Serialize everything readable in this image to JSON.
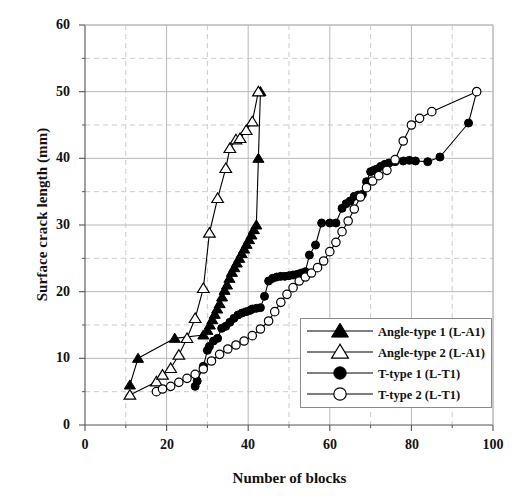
{
  "chart_data": {
    "type": "line",
    "title": "",
    "xlabel": "Number of blocks",
    "ylabel": "Surface crack length (mm)",
    "xlim": [
      0,
      100
    ],
    "ylim": [
      0,
      60
    ],
    "xticks": [
      0,
      20,
      40,
      60,
      80,
      100
    ],
    "yticks": [
      0,
      10,
      20,
      30,
      40,
      50,
      60
    ],
    "xminor_step": 10,
    "yminor_step": 5,
    "grid": true,
    "grid_major_style": "solid",
    "grid_minor_style": "dashed",
    "legend_position": "lower right",
    "series": [
      {
        "name": "Angle-type 1 (L-A1)",
        "marker": "filled-triangle",
        "color": "#000000",
        "points": [
          [
            11,
            6.0
          ],
          [
            13,
            10.0
          ],
          [
            22,
            13.0
          ],
          [
            29,
            13.5
          ],
          [
            30,
            14.2
          ],
          [
            30.6,
            15.0
          ],
          [
            31.2,
            15.8
          ],
          [
            31.8,
            16.6
          ],
          [
            32.4,
            17.4
          ],
          [
            33,
            18.2
          ],
          [
            33.6,
            19.2
          ],
          [
            34.2,
            20.2
          ],
          [
            34.8,
            21.0
          ],
          [
            35.4,
            22.0
          ],
          [
            36,
            22.9
          ],
          [
            36.6,
            23.6
          ],
          [
            37.2,
            24.3
          ],
          [
            37.8,
            25.0
          ],
          [
            38.4,
            25.7
          ],
          [
            39,
            26.4
          ],
          [
            39.6,
            27.1
          ],
          [
            40.2,
            27.8
          ],
          [
            40.8,
            28.5
          ],
          [
            41.4,
            29.3
          ],
          [
            42,
            30.0
          ],
          [
            42.5,
            40.0
          ],
          [
            43,
            50.0
          ]
        ]
      },
      {
        "name": "Angle-type 2 (L-A1)",
        "marker": "open-triangle",
        "color": "#000000",
        "points": [
          [
            11,
            4.5
          ],
          [
            17.5,
            6.5
          ],
          [
            19,
            7.5
          ],
          [
            21,
            8.5
          ],
          [
            23,
            10.5
          ],
          [
            25,
            13.0
          ],
          [
            27,
            16.0
          ],
          [
            29,
            20.5
          ],
          [
            30.5,
            28.8
          ],
          [
            32.5,
            34.0
          ],
          [
            34.5,
            38.5
          ],
          [
            35.5,
            41.5
          ],
          [
            37,
            42.8
          ],
          [
            38,
            43.0
          ],
          [
            39.5,
            44.2
          ],
          [
            41,
            45.5
          ],
          [
            42.5,
            50.0
          ]
        ]
      },
      {
        "name": "T-type 1 (L-T1)",
        "marker": "filled-circle",
        "color": "#000000",
        "points": [
          [
            27,
            5.8
          ],
          [
            27.5,
            6.6
          ],
          [
            29,
            8.8
          ],
          [
            30,
            11.2
          ],
          [
            30.5,
            11.8
          ],
          [
            31.5,
            12.6
          ],
          [
            32.5,
            13.0
          ],
          [
            33.5,
            14.5
          ],
          [
            34.5,
            14.8
          ],
          [
            35.5,
            15.4
          ],
          [
            36.5,
            16.0
          ],
          [
            37.5,
            16.5
          ],
          [
            38.5,
            16.8
          ],
          [
            39.5,
            17.0
          ],
          [
            40.5,
            17.2
          ],
          [
            41,
            17.4
          ],
          [
            42,
            17.5
          ],
          [
            43,
            17.6
          ],
          [
            44,
            19.3
          ],
          [
            45,
            21.6
          ],
          [
            46,
            22.0
          ],
          [
            47,
            22.2
          ],
          [
            48,
            22.3
          ],
          [
            49,
            22.3
          ],
          [
            50,
            22.4
          ],
          [
            51,
            22.5
          ],
          [
            52,
            22.6
          ],
          [
            53,
            22.8
          ],
          [
            54,
            23.0
          ],
          [
            55,
            25.5
          ],
          [
            56.5,
            27.0
          ],
          [
            58,
            30.3
          ],
          [
            60,
            30.3
          ],
          [
            61.5,
            30.3
          ],
          [
            63,
            32.5
          ],
          [
            64,
            33.2
          ],
          [
            65,
            33.6
          ],
          [
            66,
            34.3
          ],
          [
            67,
            34.5
          ],
          [
            68,
            34.6
          ],
          [
            69,
            36.5
          ],
          [
            70,
            38.0
          ],
          [
            70.8,
            38.2
          ],
          [
            71.5,
            38.4
          ],
          [
            72.5,
            38.8
          ],
          [
            73.5,
            39.1
          ],
          [
            74.5,
            39.3
          ],
          [
            76,
            39.5
          ],
          [
            78,
            39.6
          ],
          [
            79.5,
            39.7
          ],
          [
            81,
            39.6
          ],
          [
            84,
            39.5
          ],
          [
            87,
            40.2
          ],
          [
            94,
            45.3
          ],
          [
            96,
            50.0
          ]
        ]
      },
      {
        "name": "T-type 2 (L-T1)",
        "marker": "open-circle",
        "color": "#000000",
        "points": [
          [
            17.5,
            5.0
          ],
          [
            19,
            5.4
          ],
          [
            21,
            5.8
          ],
          [
            23,
            6.4
          ],
          [
            25,
            7.0
          ],
          [
            27,
            7.6
          ],
          [
            29,
            8.4
          ],
          [
            31,
            9.6
          ],
          [
            33,
            10.6
          ],
          [
            35,
            11.4
          ],
          [
            37,
            12.0
          ],
          [
            39,
            12.6
          ],
          [
            41,
            13.4
          ],
          [
            43,
            14.4
          ],
          [
            45,
            15.6
          ],
          [
            46.5,
            17.0
          ],
          [
            48,
            18.4
          ],
          [
            49.5,
            19.6
          ],
          [
            51,
            20.6
          ],
          [
            52.5,
            21.6
          ],
          [
            54,
            22.2
          ],
          [
            55.5,
            22.8
          ],
          [
            57,
            23.6
          ],
          [
            58.5,
            24.6
          ],
          [
            60,
            26.0
          ],
          [
            61.5,
            27.4
          ],
          [
            63,
            29.0
          ],
          [
            64.5,
            30.6
          ],
          [
            66,
            32.4
          ],
          [
            67.5,
            34.2
          ],
          [
            69,
            35.6
          ],
          [
            70.5,
            36.6
          ],
          [
            72,
            37.4
          ],
          [
            74,
            38.2
          ],
          [
            76,
            39.8
          ],
          [
            78,
            42.6
          ],
          [
            80,
            45.0
          ],
          [
            82,
            46.0
          ],
          [
            85,
            47.0
          ],
          [
            96,
            50.0
          ]
        ]
      }
    ]
  },
  "legend": {
    "entries": [
      {
        "label": "Angle-type 1 (L-A1)",
        "marker": "filled-triangle"
      },
      {
        "label": "Angle-type 2 (L-A1)",
        "marker": "open-triangle"
      },
      {
        "label": "T-type 1 (L-T1)",
        "marker": "filled-circle"
      },
      {
        "label": "T-type 2 (L-T1)",
        "marker": "open-circle"
      }
    ]
  },
  "axes": {
    "y_tick_labels": [
      "60",
      "50",
      "40",
      "30",
      "20",
      "10",
      "0"
    ],
    "x_tick_labels": [
      "0",
      "20",
      "40",
      "60",
      "80",
      "100"
    ],
    "y_axis_title": "Surface crack length (mm)",
    "x_axis_title": "Number of blocks"
  },
  "colors": {
    "ink": "#000000",
    "grid_major": "#b9b9b9",
    "grid_minor": "#cccccc",
    "axis": "#555555",
    "background": "#ffffff"
  }
}
